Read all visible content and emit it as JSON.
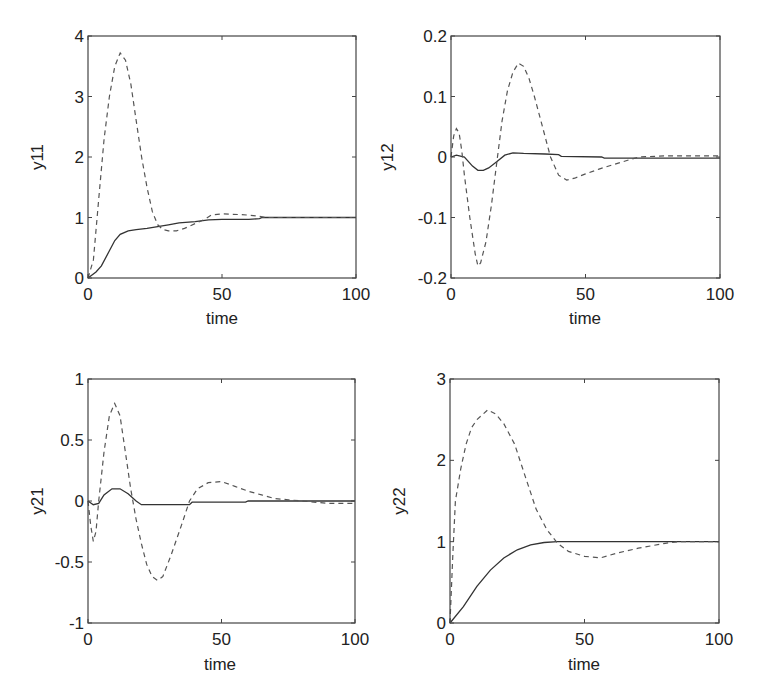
{
  "figure": {
    "panels": [
      {
        "id": "y11",
        "ylabel": "y11",
        "xlabel": "time"
      },
      {
        "id": "y12",
        "ylabel": "y12",
        "xlabel": "time"
      },
      {
        "id": "y21",
        "ylabel": "y21",
        "xlabel": "time"
      },
      {
        "id": "y22",
        "ylabel": "y22",
        "xlabel": "time"
      }
    ]
  },
  "chart_data": [
    {
      "type": "line",
      "title": "",
      "xlabel": "time",
      "ylabel": "y11",
      "xlim": [
        0,
        100
      ],
      "ylim": [
        0,
        4
      ],
      "xticks": [
        0,
        50,
        100
      ],
      "yticks": [
        0,
        1,
        2,
        3,
        4
      ],
      "ytick_labels": [
        "0",
        "1",
        "2",
        "3",
        "4"
      ],
      "grid": false,
      "legend": null,
      "series": [
        {
          "name": "solid",
          "style": "solid",
          "x": [
            0,
            3,
            5,
            8,
            10,
            12,
            15,
            18,
            22,
            26,
            30,
            34,
            40,
            45,
            50,
            60,
            64,
            65,
            100
          ],
          "y": [
            0,
            0.1,
            0.2,
            0.45,
            0.62,
            0.72,
            0.78,
            0.8,
            0.82,
            0.85,
            0.88,
            0.91,
            0.93,
            0.96,
            0.97,
            0.97,
            0.98,
            1.0,
            1.0
          ]
        },
        {
          "name": "dashed",
          "style": "dashed",
          "x": [
            0,
            2,
            4,
            6,
            8,
            10,
            12,
            14,
            16,
            18,
            20,
            22,
            24,
            26,
            28,
            30,
            33,
            36,
            40,
            44,
            46,
            50,
            56,
            60,
            64,
            66,
            100
          ],
          "y": [
            0,
            0.3,
            1.3,
            2.3,
            3.0,
            3.5,
            3.72,
            3.6,
            3.2,
            2.6,
            2.0,
            1.5,
            1.1,
            0.88,
            0.8,
            0.78,
            0.78,
            0.82,
            0.9,
            0.98,
            1.04,
            1.06,
            1.05,
            1.04,
            1.02,
            1.0,
            1.0
          ]
        }
      ]
    },
    {
      "type": "line",
      "title": "",
      "xlabel": "time",
      "ylabel": "y12",
      "xlim": [
        0,
        100
      ],
      "ylim": [
        -0.2,
        0.2
      ],
      "xticks": [
        0,
        50,
        100
      ],
      "yticks": [
        -0.2,
        -0.1,
        0,
        0.1,
        0.2
      ],
      "ytick_labels": [
        "-0.2",
        "-0.1",
        "0",
        "0.1",
        "0.2"
      ],
      "grid": false,
      "legend": null,
      "series": [
        {
          "name": "solid",
          "style": "solid",
          "x": [
            0,
            2,
            5,
            8,
            10,
            12,
            14,
            17,
            20,
            23,
            27,
            35,
            40,
            41,
            56,
            57,
            100
          ],
          "y": [
            0,
            0.003,
            0.0,
            -0.015,
            -0.022,
            -0.022,
            -0.018,
            -0.008,
            0.003,
            0.007,
            0.006,
            0.005,
            0.004,
            0.001,
            0.0,
            -0.002,
            -0.002
          ]
        },
        {
          "name": "dashed",
          "style": "dashed",
          "x": [
            0,
            1,
            2,
            3,
            4,
            5,
            7,
            9,
            10,
            11,
            13,
            15,
            17,
            19,
            21,
            23,
            25,
            27,
            29,
            31,
            34,
            37,
            40,
            43,
            46,
            50,
            55,
            60,
            66,
            70,
            80,
            100
          ],
          "y": [
            0,
            0.035,
            0.047,
            0.04,
            0.01,
            -0.03,
            -0.1,
            -0.16,
            -0.18,
            -0.175,
            -0.14,
            -0.08,
            -0.01,
            0.06,
            0.11,
            0.14,
            0.155,
            0.15,
            0.13,
            0.1,
            0.05,
            0.0,
            -0.03,
            -0.038,
            -0.035,
            -0.028,
            -0.02,
            -0.013,
            -0.005,
            0.0,
            0.002,
            0.002
          ]
        }
      ]
    },
    {
      "type": "line",
      "title": "",
      "xlabel": "time",
      "ylabel": "y21",
      "xlim": [
        0,
        100
      ],
      "ylim": [
        -1,
        1
      ],
      "xticks": [
        0,
        50,
        100
      ],
      "yticks": [
        -1,
        -0.5,
        0,
        0.5,
        1
      ],
      "ytick_labels": [
        "-1",
        "-0.5",
        "0",
        "0.5",
        "1"
      ],
      "grid": false,
      "legend": null,
      "series": [
        {
          "name": "solid",
          "style": "solid",
          "x": [
            0,
            2,
            4,
            6,
            9,
            12,
            15,
            18,
            20,
            38,
            39,
            48,
            59,
            60,
            100
          ],
          "y": [
            0,
            -0.03,
            -0.02,
            0.05,
            0.1,
            0.1,
            0.06,
            0.0,
            -0.03,
            -0.03,
            -0.01,
            -0.01,
            -0.01,
            0.0,
            0.0
          ]
        },
        {
          "name": "dashed",
          "style": "dashed",
          "x": [
            0,
            1,
            2,
            3,
            4,
            6,
            8,
            10,
            12,
            14,
            16,
            18,
            20,
            22,
            24,
            26,
            28,
            31,
            35,
            38,
            41,
            45,
            50,
            55,
            60,
            65,
            70,
            75,
            80,
            90,
            100
          ],
          "y": [
            0,
            -0.2,
            -0.33,
            -0.25,
            0.0,
            0.4,
            0.7,
            0.8,
            0.7,
            0.4,
            0.1,
            -0.15,
            -0.35,
            -0.52,
            -0.62,
            -0.65,
            -0.62,
            -0.45,
            -0.2,
            0.0,
            0.1,
            0.15,
            0.16,
            0.12,
            0.08,
            0.05,
            0.02,
            0.01,
            0.0,
            -0.02,
            -0.02
          ]
        }
      ]
    },
    {
      "type": "line",
      "title": "",
      "xlabel": "time",
      "ylabel": "y22",
      "xlim": [
        0,
        100
      ],
      "ylim": [
        0,
        3
      ],
      "xticks": [
        0,
        50,
        100
      ],
      "yticks": [
        0,
        1,
        2,
        3
      ],
      "ytick_labels": [
        "0",
        "1",
        "2",
        "3"
      ],
      "grid": false,
      "legend": null,
      "series": [
        {
          "name": "solid",
          "style": "solid",
          "x": [
            0,
            5,
            10,
            15,
            20,
            25,
            30,
            35,
            40,
            100
          ],
          "y": [
            0,
            0.2,
            0.45,
            0.65,
            0.8,
            0.9,
            0.96,
            0.99,
            1.0,
            1.0
          ]
        },
        {
          "name": "dashed",
          "style": "dashed",
          "x": [
            0,
            1,
            2,
            4,
            6,
            8,
            10,
            14,
            17,
            20,
            24,
            28,
            32,
            36,
            40,
            44,
            50,
            56,
            62,
            70,
            80,
            85,
            100
          ],
          "y": [
            0,
            0.8,
            1.5,
            1.9,
            2.2,
            2.4,
            2.5,
            2.62,
            2.57,
            2.45,
            2.2,
            1.8,
            1.4,
            1.15,
            0.98,
            0.88,
            0.82,
            0.8,
            0.86,
            0.92,
            0.98,
            1.0,
            1.0
          ]
        }
      ]
    }
  ]
}
